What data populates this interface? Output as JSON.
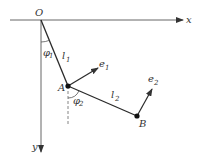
{
  "diagram": {
    "labels": {
      "origin": "O",
      "x_axis": "x",
      "y_axis": "y",
      "point_a": "A",
      "point_b": "B",
      "length_1": "l",
      "length_1_sub": "1",
      "length_2": "l",
      "length_2_sub": "2",
      "angle_1": "φ",
      "angle_1_sub": "1",
      "angle_2": "φ",
      "angle_2_sub": "2",
      "unit_1": "e",
      "unit_1_sub": "1",
      "unit_2": "e",
      "unit_2_sub": "2"
    },
    "colors": {
      "line": "#2a2a2a",
      "axis": "#555555"
    }
  }
}
